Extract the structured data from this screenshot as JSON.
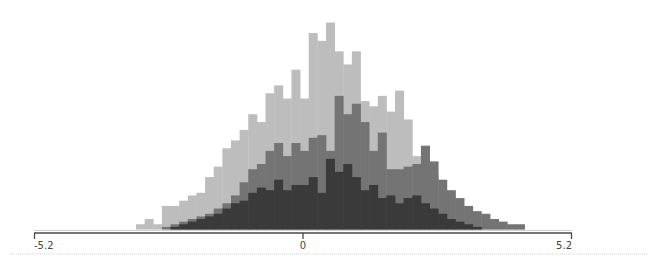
{
  "chart_data": {
    "type": "bar",
    "subtype": "overlapping-histogram",
    "title": "",
    "xlabel": "",
    "ylabel": "",
    "xlim": [
      -5.2,
      5.2
    ],
    "x_ticks": [
      {
        "value": -5.2,
        "label": "-5.2"
      },
      {
        "value": 0,
        "label": "0"
      },
      {
        "value": 5.2,
        "label": "5.2"
      }
    ],
    "grid": false,
    "legend": null,
    "bin_width": 0.167,
    "bin_start": -3.23,
    "series": [
      {
        "name": "light",
        "color": "#bdbdbd",
        "start_bin": 0,
        "counts": [
          2,
          4,
          2,
          9,
          9,
          11,
          13,
          14,
          20,
          24,
          31,
          34,
          38,
          44,
          41,
          52,
          55,
          50,
          61,
          50,
          75,
          72,
          79,
          68,
          63,
          68,
          49,
          47,
          51,
          45,
          53,
          42,
          28,
          24,
          21,
          15,
          11,
          8,
          6,
          4,
          3,
          2,
          2,
          1,
          1
        ]
      },
      {
        "name": "medium",
        "color": "#747474",
        "start_bin": 3,
        "counts": [
          1,
          2,
          3,
          4,
          5,
          6,
          8,
          10,
          13,
          18,
          23,
          25,
          30,
          33,
          28,
          33,
          30,
          35,
          36,
          30,
          51,
          44,
          48,
          41,
          30,
          37,
          23,
          23,
          24,
          25,
          32,
          26,
          19,
          15,
          12,
          9,
          7,
          6,
          4,
          3,
          2,
          2
        ]
      },
      {
        "name": "dark",
        "color": "#3a3a3a",
        "start_bin": 4,
        "counts": [
          1,
          2,
          3,
          4,
          5,
          6,
          8,
          10,
          11,
          14,
          16,
          15,
          19,
          15,
          17,
          17,
          20,
          14,
          27,
          22,
          25,
          20,
          15,
          17,
          12,
          13,
          10,
          12,
          13,
          10,
          8,
          6,
          4,
          3,
          2,
          1
        ]
      }
    ]
  },
  "axis": {
    "labels": [
      "-5.2",
      "0",
      "5.2"
    ]
  }
}
